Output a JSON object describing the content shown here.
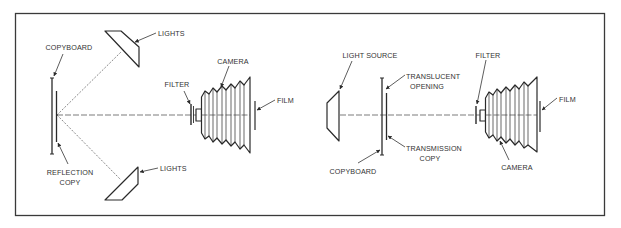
{
  "diagram": {
    "colors": {
      "line": "#2a2a2a",
      "text": "#333333",
      "background": "#ffffff",
      "frame": "#3a3a3a"
    },
    "left_panel": {
      "name": "Reflection copy setup",
      "labels": {
        "copyboard": "COPYBOARD",
        "lights_top": "LIGHTS",
        "lights_bottom": "LIGHTS",
        "camera": "CAMERA",
        "filter": "FILTER",
        "film": "FILM",
        "reflection_line1": "REFLECTION",
        "reflection_line2": "COPY"
      }
    },
    "right_panel": {
      "name": "Transmission copy setup",
      "labels": {
        "light_source": "LIGHT SOURCE",
        "translucent_line1": "TRANSLUCENT",
        "translucent_line2": "OPENING",
        "transmission_line1": "TRANSMISSION",
        "transmission_line2": "COPY",
        "copyboard": "COPYBOARD",
        "filter": "FILTER",
        "film": "FILM",
        "camera": "CAMERA"
      }
    }
  }
}
